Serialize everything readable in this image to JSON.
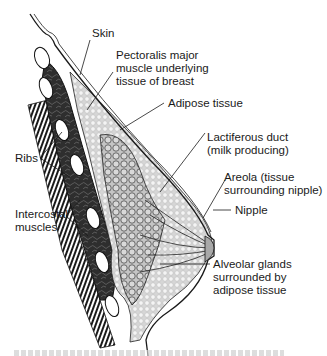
{
  "figure": {
    "labels": {
      "skin": "Skin",
      "pectoralis_line1": "Pectoralis major",
      "pectoralis_line2": "muscle underlying",
      "pectoralis_line3": "tissue of breast",
      "adipose": "Adipose tissue",
      "lactiferous_line1": "Lactiferous duct",
      "lactiferous_line2": "(milk producing)",
      "areola_line1": "Areola (tissue",
      "areola_line2": "surrounding nipple)",
      "nipple": "Nipple",
      "ribs": "Ribs",
      "intercostal_line1": "Intercostal",
      "intercostal_line2": "muscles",
      "alveolar_line1": "Alveolar glands",
      "alveolar_line2": "surrounded by",
      "alveolar_line3": "adipose tissue"
    },
    "colors": {
      "ink": "#1a1a1a",
      "muscle": "#3a3a3a",
      "adipose": "#d9d9d9",
      "gland": "#bdbdbd",
      "background": "#ffffff"
    }
  }
}
